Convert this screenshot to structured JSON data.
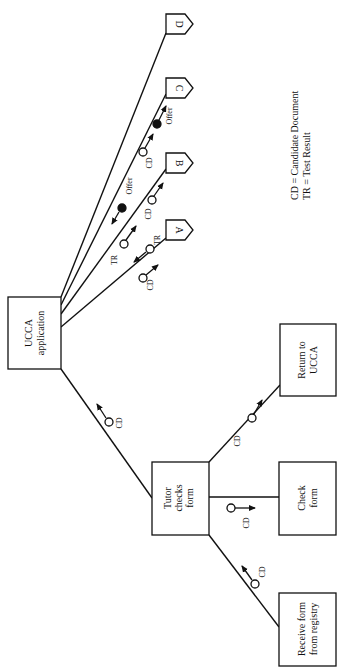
{
  "diagram": {
    "orientation": "rotated-90-ccw",
    "nodes": {
      "ucca": {
        "line1": "UCCA",
        "line2": "application"
      },
      "tutor": {
        "line1": "Tutor",
        "line2": "checks",
        "line3": "form"
      },
      "return": {
        "line1": "Return to",
        "line2": "UCCA"
      },
      "check": {
        "line1": "Check",
        "line2": "form"
      },
      "receive": {
        "line1": "Receive form",
        "line2": "from registry"
      }
    },
    "flags": {
      "a": "A",
      "b": "B",
      "c": "C",
      "d": "D"
    },
    "tokens": {
      "ucca_tutor": "CD",
      "tutor_return": "CD",
      "tutor_check": "CD",
      "receive_tutor": "CD",
      "a_cd": "CD",
      "a_tr": "TR",
      "b_tr": "TR",
      "b_cd": "CD",
      "c_offer": "Offer",
      "c_cd": "CD",
      "c_offer2": "Offer"
    },
    "legend": {
      "line1": "CD = Candidate Document",
      "line2": "TR = Test Result"
    },
    "colors": {
      "stroke": "#111111",
      "background": "#ffffff"
    }
  }
}
